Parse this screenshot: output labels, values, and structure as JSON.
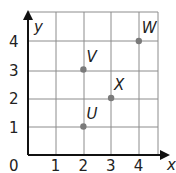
{
  "chart_data": {
    "type": "scatter",
    "title": "",
    "xlabel": "x",
    "ylabel": "y",
    "xlim": [
      0,
      4.7
    ],
    "ylim": [
      0,
      5
    ],
    "grid": true,
    "x_ticks": [
      "0",
      "1",
      "2",
      "3",
      "4"
    ],
    "y_ticks": [
      "1",
      "2",
      "3",
      "4"
    ],
    "points": [
      {
        "label": "U",
        "x": 2,
        "y": 1
      },
      {
        "label": "V",
        "x": 2,
        "y": 3
      },
      {
        "label": "X",
        "x": 3,
        "y": 2
      },
      {
        "label": "W",
        "x": 4,
        "y": 4
      }
    ],
    "colors": {
      "grid": "#8a8a8a",
      "axis": "#111111",
      "point": "#7a7a7a"
    }
  }
}
